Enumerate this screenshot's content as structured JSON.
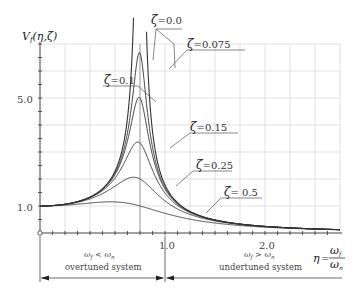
{
  "chart_data": {
    "type": "line",
    "title": "",
    "ylabel": "V_f(η,ζ)",
    "xlabel": "η = ω_f / ω_n",
    "xlim": [
      0,
      3.0
    ],
    "ylim": [
      0,
      7.0
    ],
    "x_ticks": [
      {
        "value": 1.0,
        "label": "1.0"
      },
      {
        "value": 2.0,
        "label": "2.0"
      }
    ],
    "y_ticks": [
      {
        "value": 1.0,
        "label": "1.0"
      },
      {
        "value": 5.0,
        "label": "5.0"
      }
    ],
    "grid": true,
    "formula": "V = 1 / sqrt((1-η²)² + (2ζη)²)",
    "series": [
      {
        "name": "ζ=0.0",
        "zeta": 0.0,
        "peak": "unbounded at η=1.0"
      },
      {
        "name": "ζ=0.075",
        "zeta": 0.075,
        "peak_eta": 0.99,
        "peak_value": 6.68
      },
      {
        "name": "ζ=0.1",
        "zeta": 0.1,
        "peak_eta": 0.99,
        "peak_value": 5.03
      },
      {
        "name": "ζ=0.15",
        "zeta": 0.15,
        "peak_eta": 0.98,
        "peak_value": 3.37
      },
      {
        "name": "ζ=0.25",
        "zeta": 0.25,
        "peak_eta": 0.94,
        "peak_value": 2.07
      },
      {
        "name": "ζ=0.5",
        "zeta": 0.5,
        "peak_eta": 0.71,
        "peak_value": 1.15
      }
    ],
    "annotations": [
      {
        "text": "ω_f < ω_n",
        "subtext": "overtuned system",
        "range": [
          0,
          1.0
        ]
      },
      {
        "text": "ω_f > ω_n",
        "subtext": "undertuned system",
        "range": [
          1.0,
          3.0
        ]
      }
    ]
  },
  "axes": {
    "y_title_main": "V",
    "y_title_sub": "f",
    "y_title_args": "(η,ζ)",
    "x_title_eta": "η",
    "x_title_eq": "=",
    "x_title_num": "ω",
    "x_title_num_sub": "f",
    "x_title_den": "ω",
    "x_title_den_sub": "n",
    "y_label_1": "1.0",
    "y_label_5": "5.0",
    "x_label_1": "1.0",
    "x_label_2": "2.0"
  },
  "labels": {
    "z0": "=0.0",
    "z0075": "=0.075",
    "z01": "=0.1",
    "z015": "=0.15",
    "z025": "=0.25",
    "z05": "= 0.5",
    "zeta": "ζ"
  },
  "regions": {
    "left_math_a": "ω",
    "left_math_a_sub": "f",
    "left_math_op": " < ",
    "left_math_b": "ω",
    "left_math_b_sub": "n",
    "left_text": "overtuned system",
    "right_math_a": "ω",
    "right_math_a_sub": "f",
    "right_math_op": " > ",
    "right_math_b": "ω",
    "right_math_b_sub": "n",
    "right_text": "undertuned system"
  }
}
